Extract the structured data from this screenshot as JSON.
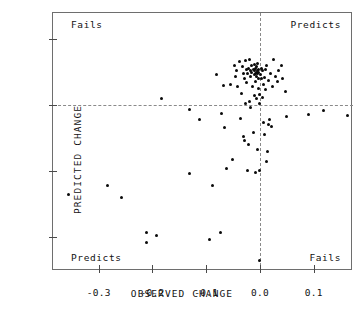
{
  "chart_data": {
    "type": "scatter",
    "title": "",
    "xlabel": "OBSERVED CHANGE",
    "ylabel": "PREDICTED CHANGE",
    "xlim": [
      -0.385,
      0.173
    ],
    "ylim": [
      -126,
      70
    ],
    "xticks": [
      -0.3,
      -0.2,
      -0.1,
      0.0,
      0.1
    ],
    "xticklabels": [
      "-0.3",
      "-0.2",
      "-0.1",
      "0.0",
      "0.1"
    ],
    "yticks": [
      50,
      0,
      -50,
      -100
    ],
    "yticklabels": [
      "50",
      "0",
      "-50",
      "-100"
    ],
    "grid": false,
    "legend": null,
    "reference_lines": [
      {
        "axis": "horizontal",
        "value": 0,
        "style": "dashed"
      },
      {
        "axis": "vertical",
        "value": 0,
        "style": "dashed"
      }
    ],
    "annotations": [
      {
        "text": "Fails",
        "quadrant": "top-left"
      },
      {
        "text": "Predicts",
        "quadrant": "top-right"
      },
      {
        "text": "Predicts",
        "quadrant": "bottom-left"
      },
      {
        "text": "Fails",
        "quadrant": "bottom-right"
      }
    ],
    "points": [
      [
        -0.357,
        -68
      ],
      [
        -0.283,
        -61
      ],
      [
        -0.257,
        -70
      ],
      [
        -0.212,
        -97
      ],
      [
        -0.212,
        -104
      ],
      [
        -0.192,
        -99
      ],
      [
        -0.183,
        5
      ],
      [
        -0.132,
        -52
      ],
      [
        -0.131,
        -3
      ],
      [
        -0.112,
        -11
      ],
      [
        -0.093,
        -102
      ],
      [
        -0.089,
        -61
      ],
      [
        -0.081,
        23
      ],
      [
        -0.074,
        -97
      ],
      [
        -0.072,
        -6
      ],
      [
        -0.068,
        15
      ],
      [
        -0.066,
        -17
      ],
      [
        -0.062,
        -48
      ],
      [
        -0.055,
        16
      ],
      [
        -0.052,
        -41
      ],
      [
        -0.048,
        30
      ],
      [
        -0.046,
        22
      ],
      [
        -0.043,
        26
      ],
      [
        -0.041,
        14
      ],
      [
        -0.038,
        33
      ],
      [
        -0.036,
        -10
      ],
      [
        -0.034,
        9
      ],
      [
        -0.033,
        29
      ],
      [
        -0.031,
        24
      ],
      [
        -0.03,
        -24
      ],
      [
        -0.029,
        20
      ],
      [
        -0.028,
        -27
      ],
      [
        -0.027,
        34
      ],
      [
        -0.027,
        1
      ],
      [
        -0.026,
        27
      ],
      [
        -0.025,
        17
      ],
      [
        -0.024,
        -50
      ],
      [
        -0.023,
        24
      ],
      [
        -0.022,
        -30
      ],
      [
        -0.021,
        28
      ],
      [
        -0.02,
        3
      ],
      [
        -0.019,
        35
      ],
      [
        -0.018,
        26
      ],
      [
        -0.018,
        -2
      ],
      [
        -0.017,
        22
      ],
      [
        -0.016,
        30
      ],
      [
        -0.015,
        25
      ],
      [
        -0.014,
        14
      ],
      [
        -0.013,
        27
      ],
      [
        -0.012,
        -21
      ],
      [
        -0.011,
        31
      ],
      [
        -0.011,
        7
      ],
      [
        -0.01,
        23
      ],
      [
        -0.01,
        26
      ],
      [
        -0.009,
        24
      ],
      [
        -0.009,
        -51
      ],
      [
        -0.008,
        28
      ],
      [
        -0.008,
        18
      ],
      [
        -0.007,
        25
      ],
      [
        -0.007,
        5
      ],
      [
        -0.006,
        29
      ],
      [
        -0.006,
        22
      ],
      [
        -0.005,
        26
      ],
      [
        -0.005,
        -34
      ],
      [
        -0.004,
        24
      ],
      [
        -0.004,
        32
      ],
      [
        -0.003,
        20
      ],
      [
        -0.003,
        27
      ],
      [
        -0.002,
        13
      ],
      [
        -0.002,
        25
      ],
      [
        -0.001,
        8
      ],
      [
        -0.001,
        -50
      ],
      [
        0.0,
        1
      ],
      [
        0.0,
        -118
      ],
      [
        0.001,
        23
      ],
      [
        0.002,
        28
      ],
      [
        0.003,
        20
      ],
      [
        0.004,
        6
      ],
      [
        0.005,
        26
      ],
      [
        0.006,
        16
      ],
      [
        0.007,
        -13
      ],
      [
        0.008,
        21
      ],
      [
        0.009,
        -22
      ],
      [
        0.01,
        12
      ],
      [
        0.011,
        27
      ],
      [
        0.012,
        -43
      ],
      [
        0.013,
        30
      ],
      [
        0.014,
        -35
      ],
      [
        0.015,
        19
      ],
      [
        0.016,
        -15
      ],
      [
        0.018,
        -11
      ],
      [
        0.02,
        24
      ],
      [
        0.022,
        -16
      ],
      [
        0.024,
        14
      ],
      [
        0.026,
        35
      ],
      [
        0.028,
        22
      ],
      [
        0.032,
        18
      ],
      [
        0.035,
        26
      ],
      [
        0.04,
        30
      ],
      [
        0.042,
        20
      ],
      [
        0.048,
        10
      ],
      [
        0.05,
        -9
      ],
      [
        0.09,
        -7
      ],
      [
        0.118,
        -4
      ],
      [
        0.163,
        -8
      ]
    ]
  },
  "axis": {
    "x_title": "OBSERVED CHANGE",
    "y_title": "PREDICTED CHANGE"
  },
  "labels": {
    "top_left": "Fails",
    "top_right": "Predicts",
    "bottom_left": "Predicts",
    "bottom_right": "Fails"
  },
  "colors": {
    "point": "#0a0a0a",
    "frame": "#6e6e6e",
    "dash": "#8a8a8a",
    "text": "#111111",
    "background": "#ffffff"
  }
}
